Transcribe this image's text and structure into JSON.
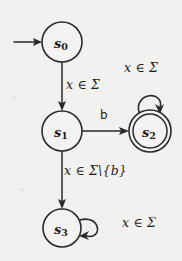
{
  "figure": {
    "kind": "finite-state-automaton",
    "background_color": "#f2f1ef",
    "ink_color": "#2b2a28"
  },
  "states": [
    {
      "id": "s0",
      "name": "s",
      "subscript": "0",
      "accepting": false,
      "cx": 62,
      "cy": 42,
      "r": 20
    },
    {
      "id": "s1",
      "name": "s",
      "subscript": "1",
      "accepting": false,
      "cx": 62,
      "cy": 131,
      "r": 20
    },
    {
      "id": "s2",
      "name": "s",
      "subscript": "2",
      "accepting": true,
      "cx": 150,
      "cy": 131,
      "r": 21
    },
    {
      "id": "s3",
      "name": "s",
      "subscript": "3",
      "accepting": false,
      "cx": 62,
      "cy": 228,
      "r": 19
    }
  ],
  "start_marker": {
    "label": "start-arrow",
    "target": "s0"
  },
  "transitions": [
    {
      "id": "t0",
      "from": "s0",
      "to": "s1",
      "label": "x ∈ Σ",
      "label_var": "x",
      "label_rest": " ∈ ",
      "label_symbol": "Σ"
    },
    {
      "id": "t1",
      "from": "s1",
      "to": "s2",
      "label": "b"
    },
    {
      "id": "t2",
      "from": "s2",
      "to": "s2",
      "label": "x ∈ Σ",
      "label_var": "x",
      "label_rest": " ∈ ",
      "label_symbol": "Σ",
      "self_loop": true
    },
    {
      "id": "t3",
      "from": "s1",
      "to": "s3",
      "label": "x ∈ Σ\\{b}",
      "label_var": "x",
      "label_rest": " ∈ ",
      "label_symbol": "Σ\\{b}"
    },
    {
      "id": "t4",
      "from": "s3",
      "to": "s3",
      "label": "x ∈ Σ",
      "label_var": "x",
      "label_rest": " ∈ ",
      "label_symbol": "Σ",
      "self_loop": true
    }
  ],
  "labels": {
    "s0_to_s1": {
      "var": "x",
      "op": " ∈ ",
      "set": "Σ"
    },
    "s1_to_s2": {
      "text": "b"
    },
    "s2_loop": {
      "var": "x",
      "op": " ∈ ",
      "set": "Σ"
    },
    "s1_to_s3": {
      "var": "x",
      "op": " ∈ ",
      "set": "Σ\\{b}"
    },
    "s3_loop": {
      "var": "x",
      "op": " ∈ ",
      "set": "Σ"
    }
  }
}
